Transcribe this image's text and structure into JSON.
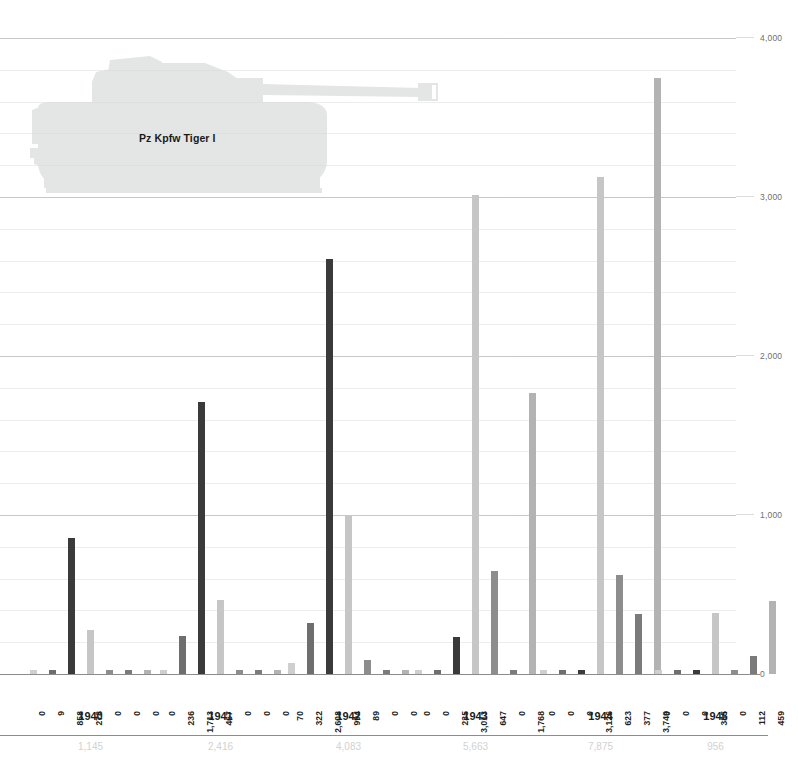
{
  "chart_data": {
    "type": "bar",
    "title": "Pz Kpfw Tiger I",
    "xlabel": "",
    "ylabel": "",
    "ylim": [
      0,
      4000
    ],
    "grid": true,
    "legend_position": "none",
    "axis_side": "right",
    "categories": [
      "1940",
      "1941",
      "1942",
      "1943",
      "1944",
      "1945"
    ],
    "yticks": [
      "0",
      "1,000",
      "2,000",
      "3,000",
      "4,000"
    ],
    "ytick_values": [
      0,
      1000,
      2000,
      3000,
      4000
    ],
    "bars_per_group": 7,
    "series": [
      {
        "name": "s1",
        "color": "#cfcfcf",
        "values": [
          0,
          0,
          70,
          0,
          0,
          0
        ]
      },
      {
        "name": "s2",
        "color": "#6e6e6e",
        "values": [
          9,
          236,
          322,
          0,
          0,
          0
        ]
      },
      {
        "name": "s3",
        "color": "#3a3a3a",
        "values": [
          858,
          1713,
          2608,
          235,
          0,
          0
        ]
      },
      {
        "name": "s4",
        "color": "#c6c6c6",
        "values": [
          278,
          467,
          994,
          3013,
          3126,
          385
        ]
      },
      {
        "name": "s5",
        "color": "#8d8d8d",
        "values": [
          0,
          0,
          89,
          647,
          623,
          0
        ]
      },
      {
        "name": "s6",
        "color": "#7b7b7b",
        "values": [
          0,
          0,
          0,
          0,
          377,
          112
        ]
      },
      {
        "name": "s7",
        "color": "#b3b3b3",
        "values": [
          0,
          0,
          0,
          1768,
          3749,
          459
        ]
      }
    ],
    "value_labels": [
      [
        "0",
        "9",
        "858",
        "278",
        "0",
        "0",
        "0"
      ],
      [
        "0",
        "236",
        "1,713",
        "467",
        "0",
        "0",
        "0"
      ],
      [
        "70",
        "322",
        "2,608",
        "994",
        "89",
        "0",
        "0"
      ],
      [
        "0",
        "0",
        "235",
        "3,013",
        "647",
        "0",
        "1,768"
      ],
      [
        "0",
        "0",
        "0",
        "3,126",
        "623",
        "377",
        "3,749"
      ],
      [
        "0",
        "0",
        "0",
        "385",
        "0",
        "112",
        "459"
      ]
    ],
    "group_totals": [
      "1,145",
      "2,416",
      "4,083",
      "5,663",
      "7,875",
      "956"
    ],
    "group_total_values": [
      1145,
      2416,
      4083,
      5663,
      7875,
      956
    ]
  },
  "watermark": {
    "label": "Pz Kpfw Tiger I",
    "icon": "tank-silhouette",
    "color": "#e4e6e6"
  },
  "colors": {
    "gridline": "#9a9a9a",
    "axis": "#8c8c8c",
    "value_label": "#1d1d1d",
    "total_label": "#d2d2d2",
    "background": "#ffffff"
  }
}
